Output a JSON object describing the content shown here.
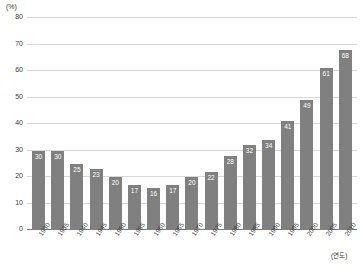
{
  "chart_data": {
    "type": "bar",
    "title": "",
    "subtitle": "",
    "xlabel": "(연도)",
    "ylabel": "(%)",
    "categories": [
      "1930",
      "1935",
      "1940",
      "1945",
      "1950",
      "1955",
      "1960",
      "1965",
      "1970",
      "1975",
      "1980",
      "1985",
      "1990",
      "1995",
      "2000",
      "2005",
      "2010"
    ],
    "values": [
      30,
      30,
      25,
      23,
      20,
      17,
      16,
      17,
      20,
      22,
      28,
      32,
      34,
      41,
      49,
      61,
      68
    ],
    "series": [
      {
        "name": "",
        "values": [
          30,
          30,
          25,
          23,
          20,
          17,
          16,
          17,
          20,
          22,
          28,
          32,
          34,
          41,
          49,
          61,
          68
        ]
      }
    ],
    "ylim": [
      0,
      80
    ],
    "ytick_labels": [
      "0",
      "10",
      "20",
      "30",
      "40",
      "50",
      "60",
      "70",
      "80"
    ],
    "ytick_values": [
      0,
      10,
      20,
      30,
      40,
      50,
      60,
      70,
      80
    ],
    "grid": true,
    "legend": false,
    "legend_position": "none",
    "bar_color": "#808080",
    "value_label_color": "#ffffff",
    "gridline_color": "#d8d8d8",
    "axis_color": "#7a7a7a",
    "show_value_labels": true
  }
}
